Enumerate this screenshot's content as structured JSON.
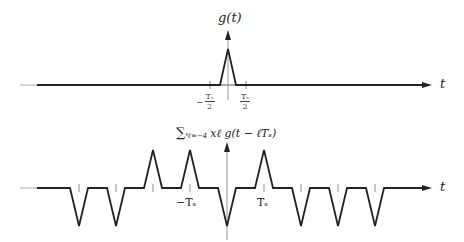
{
  "top_plot": {
    "ylabel": "g(t)",
    "xlabel": "t",
    "tick_left": {
      "sign": "−",
      "num": "Tₛ",
      "den": "2"
    },
    "tick_right": {
      "num": "Tₛ",
      "den": "2"
    },
    "pulse": {
      "center_x": 228,
      "half_width": 8,
      "height": 36
    }
  },
  "bottom_plot": {
    "ylabel": "∑ℓ=−4⁴ xℓ g(t − ℓTₛ)",
    "ylabel_sum": "∑",
    "ylabel_limits": "⁴ℓ=−4",
    "ylabel_body": "xℓ g(t − ℓTₛ)",
    "xlabel": "t",
    "tick_neg": "−Tₛ",
    "tick_pos": "Tₛ",
    "symbols": [
      {
        "ell": -4,
        "x": -1
      },
      {
        "ell": -3,
        "x": -1
      },
      {
        "ell": -2,
        "x": 1
      },
      {
        "ell": -1,
        "x": 1
      },
      {
        "ell": 0,
        "x": -1
      },
      {
        "ell": 1,
        "x": 1
      },
      {
        "ell": 2,
        "x": -1
      },
      {
        "ell": 3,
        "x": -1
      },
      {
        "ell": 4,
        "x": -1
      }
    ]
  },
  "colors": {
    "signal": "#222222",
    "axis": "#999999"
  }
}
